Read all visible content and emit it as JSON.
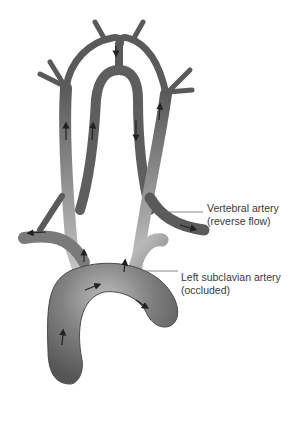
{
  "diagram": {
    "labels": {
      "vertebral": {
        "line1": "Vertebral artery",
        "line2": "(reverse flow)"
      },
      "subclavian": {
        "line1": "Left subclavian artery",
        "line2": "(occluded)"
      }
    },
    "colors": {
      "vessel_dark": "#555555",
      "vessel_mid": "#7a7a7a",
      "vessel_light": "#bdbdbd",
      "occluded": "#a8a8a8",
      "leader_line": "#6a6a6a",
      "arrow": "#222222",
      "text": "#3a3a3a",
      "background": "#ffffff"
    }
  }
}
